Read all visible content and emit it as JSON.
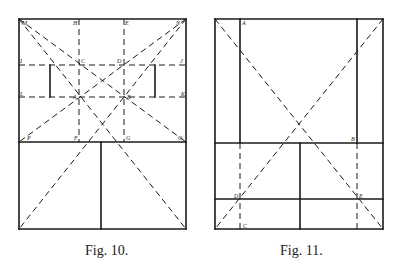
{
  "figures": [
    {
      "id": "fig10",
      "caption": "Fig. 10.",
      "caption_pos": {
        "x": 85,
        "y": 243
      },
      "solid_lines": [
        [
          19,
          19,
          186,
          19
        ],
        [
          186,
          19,
          186,
          229
        ],
        [
          186,
          229,
          19,
          229
        ],
        [
          19,
          229,
          19,
          19
        ],
        [
          19,
          142,
          186,
          142
        ],
        [
          101,
          142,
          101,
          229
        ],
        [
          50,
          65,
          50,
          97
        ],
        [
          155,
          65,
          155,
          97
        ]
      ],
      "dashed_lines": [
        [
          79,
          19,
          79,
          142
        ],
        [
          124,
          19,
          124,
          142
        ],
        [
          19,
          65,
          186,
          65
        ],
        [
          19,
          97,
          186,
          97
        ],
        [
          19,
          19,
          186,
          142
        ],
        [
          186,
          19,
          19,
          142
        ],
        [
          19,
          19,
          186,
          229
        ],
        [
          186,
          19,
          19,
          229
        ]
      ],
      "labels": [
        {
          "t": "M",
          "x": 22,
          "y": 25
        },
        {
          "t": "H",
          "x": 73,
          "y": 25
        },
        {
          "t": "E",
          "x": 125,
          "y": 25
        },
        {
          "t": "N",
          "x": 176,
          "y": 25
        },
        {
          "t": "I",
          "x": 20,
          "y": 63
        },
        {
          "t": "C",
          "x": 81,
          "y": 63
        },
        {
          "t": "D",
          "x": 117,
          "y": 63
        },
        {
          "t": "J",
          "x": 180,
          "y": 63
        },
        {
          "t": "L",
          "x": 20,
          "y": 96
        },
        {
          "t": "A",
          "x": 73,
          "y": 99
        },
        {
          "t": "B",
          "x": 127,
          "y": 99
        },
        {
          "t": "K",
          "x": 181,
          "y": 96
        },
        {
          "t": "P",
          "x": 27,
          "y": 140
        },
        {
          "t": "F",
          "x": 74,
          "y": 140
        },
        {
          "t": "G",
          "x": 126,
          "y": 140
        },
        {
          "t": "O",
          "x": 178,
          "y": 140
        }
      ]
    },
    {
      "id": "fig11",
      "caption": "Fig. 11.",
      "caption_pos": {
        "x": 280,
        "y": 243
      },
      "solid_lines": [
        [
          215,
          19,
          383,
          19
        ],
        [
          383,
          19,
          383,
          229
        ],
        [
          383,
          229,
          215,
          229
        ],
        [
          215,
          229,
          215,
          19
        ],
        [
          240,
          19,
          240,
          143
        ],
        [
          357,
          19,
          357,
          143
        ],
        [
          215,
          143,
          383,
          143
        ],
        [
          215,
          199,
          383,
          199
        ],
        [
          300,
          143,
          300,
          229
        ]
      ],
      "dashed_lines": [
        [
          215,
          19,
          383,
          229
        ],
        [
          383,
          19,
          215,
          229
        ],
        [
          240,
          143,
          240,
          229
        ],
        [
          357,
          143,
          357,
          229
        ]
      ],
      "labels": [
        {
          "t": "A",
          "x": 242,
          "y": 25
        },
        {
          "t": "B",
          "x": 351,
          "y": 141
        },
        {
          "t": "D",
          "x": 234,
          "y": 198
        },
        {
          "t": "E",
          "x": 359,
          "y": 198
        },
        {
          "t": "C",
          "x": 243,
          "y": 228
        }
      ]
    }
  ],
  "style": {
    "stroke": "#1a1a1a",
    "solid_width": 1.6,
    "dashed_width": 1.0,
    "dash": "6 4"
  }
}
